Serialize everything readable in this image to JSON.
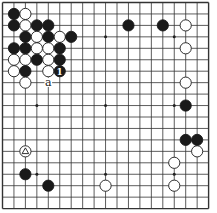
{
  "board": {
    "size": 19,
    "origin": [
      2.5,
      2.5
    ],
    "spacing": 11.45,
    "line_color": "#333333",
    "background": "#ffffff",
    "stone_radius": 5.6
  },
  "star_points": [
    [
      3,
      3
    ],
    [
      9,
      3
    ],
    [
      15,
      3
    ],
    [
      3,
      9
    ],
    [
      9,
      9
    ],
    [
      15,
      9
    ],
    [
      3,
      15
    ],
    [
      9,
      15
    ],
    [
      15,
      15
    ]
  ],
  "stones": [
    {
      "col": 1,
      "row": 1,
      "color": "black"
    },
    {
      "col": 2,
      "row": 1,
      "color": "white"
    },
    {
      "col": 1,
      "row": 2,
      "color": "black"
    },
    {
      "col": 2,
      "row": 2,
      "color": "white"
    },
    {
      "col": 3,
      "row": 2,
      "color": "black"
    },
    {
      "col": 4,
      "row": 2,
      "color": "black"
    },
    {
      "col": 2,
      "row": 3,
      "color": "black"
    },
    {
      "col": 3,
      "row": 3,
      "color": "white"
    },
    {
      "col": 4,
      "row": 3,
      "color": "black"
    },
    {
      "col": 5,
      "row": 3,
      "color": "white"
    },
    {
      "col": 6,
      "row": 3,
      "color": "black"
    },
    {
      "col": 1,
      "row": 4,
      "color": "black"
    },
    {
      "col": 2,
      "row": 4,
      "color": "black"
    },
    {
      "col": 3,
      "row": 4,
      "color": "white"
    },
    {
      "col": 4,
      "row": 4,
      "color": "white"
    },
    {
      "col": 5,
      "row": 4,
      "color": "black"
    },
    {
      "col": 1,
      "row": 5,
      "color": "white"
    },
    {
      "col": 2,
      "row": 5,
      "color": "white"
    },
    {
      "col": 3,
      "row": 5,
      "color": "black"
    },
    {
      "col": 4,
      "row": 5,
      "color": "white"
    },
    {
      "col": 5,
      "row": 5,
      "color": "black"
    },
    {
      "col": 1,
      "row": 6,
      "color": "white"
    },
    {
      "col": 2,
      "row": 6,
      "color": "black"
    },
    {
      "col": 4,
      "row": 6,
      "color": "white"
    },
    {
      "col": 5,
      "row": 6,
      "color": "black",
      "label": "1"
    },
    {
      "col": 2,
      "row": 7,
      "color": "white"
    },
    {
      "col": 11,
      "row": 2,
      "color": "black"
    },
    {
      "col": 14,
      "row": 2,
      "color": "black"
    },
    {
      "col": 16,
      "row": 2,
      "color": "white"
    },
    {
      "col": 16,
      "row": 4,
      "color": "white"
    },
    {
      "col": 16,
      "row": 7,
      "color": "white"
    },
    {
      "col": 16,
      "row": 9,
      "color": "black"
    },
    {
      "col": 16,
      "row": 12,
      "color": "black"
    },
    {
      "col": 17,
      "row": 12,
      "color": "black"
    },
    {
      "col": 17,
      "row": 13,
      "color": "white"
    },
    {
      "col": 15,
      "row": 14,
      "color": "white"
    },
    {
      "col": 15,
      "row": 16,
      "color": "white"
    },
    {
      "col": 9,
      "row": 16,
      "color": "white"
    },
    {
      "col": 2,
      "row": 13,
      "color": "white",
      "marker": "triangle"
    },
    {
      "col": 2,
      "row": 15,
      "color": "black"
    },
    {
      "col": 4,
      "row": 16,
      "color": "black"
    }
  ],
  "labels": [
    {
      "col": 4,
      "row": 7,
      "text": "a"
    }
  ]
}
